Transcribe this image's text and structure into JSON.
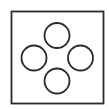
{
  "diagram": {
    "width": 109,
    "height": 109,
    "background": "#ffffff",
    "stroke_color": "#2a2a2a",
    "frame": {
      "x": 11.5,
      "y": 11.5,
      "width": 92,
      "height": 92,
      "stroke_width": 1.8
    },
    "circles": [
      {
        "name": "top-circle",
        "cx": 57,
        "cy": 35.5,
        "r": 12.5
      },
      {
        "name": "left-circle",
        "cx": 34,
        "cy": 58,
        "r": 12.5
      },
      {
        "name": "right-circle",
        "cx": 80.5,
        "cy": 58,
        "r": 12.5
      },
      {
        "name": "bottom-circle",
        "cx": 57,
        "cy": 81,
        "r": 12.5
      }
    ],
    "circle_stroke_width": 1.8,
    "circle_fill": "#ffffff"
  }
}
